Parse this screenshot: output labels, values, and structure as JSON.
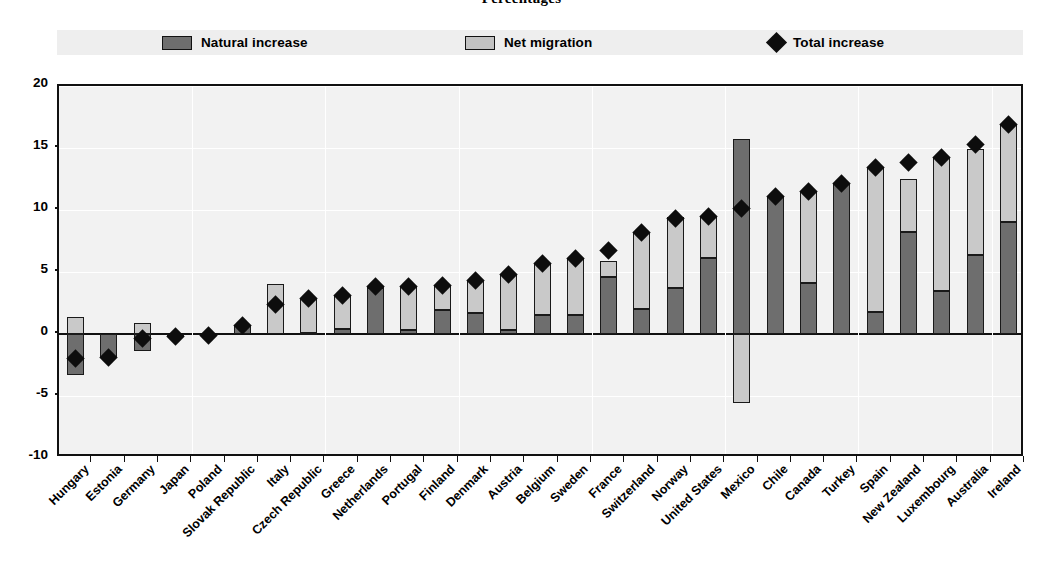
{
  "chart_data": {
    "type": "bar",
    "subtype": "stacked-bar-with-marker",
    "title": "Percentages",
    "xlabel": "",
    "ylabel": "",
    "ylim": [
      -10,
      20
    ],
    "yticks": [
      20,
      15,
      10,
      5,
      0,
      -5,
      -10
    ],
    "ytick_labels": [
      "20",
      "15",
      "10",
      "5",
      "0",
      "-5",
      "-10"
    ],
    "grid": true,
    "legend_position": "top",
    "colors": {
      "natural_increase": "#6e6e6e",
      "net_migration": "#c9c9c9",
      "total_increase": "#0d0d0d",
      "plot_background": "#f2f2f2",
      "legend_background": "#eeeeee",
      "axis": "#111111"
    },
    "legend": [
      {
        "label": "Natural increase",
        "marker": "square",
        "color": "#6e6e6e"
      },
      {
        "label": "Net migration",
        "marker": "square",
        "color": "#c9c9c9"
      },
      {
        "label": "Total increase",
        "marker": "diamond",
        "color": "#0d0d0d"
      }
    ],
    "categories": [
      "Hungary",
      "Estonia",
      "Germany",
      "Japan",
      "Poland",
      "Slovak Republic",
      "Italy",
      "Czech Republic",
      "Greece",
      "Netherlands",
      "Portugal",
      "Finland",
      "Denmark",
      "Austria",
      "Belgium",
      "Sweden",
      "France",
      "Switzerland",
      "Norway",
      "United States",
      "Mexico",
      "Chile",
      "Canada",
      "Turkey",
      "Spain",
      "New Zealand",
      "Luxembourg",
      "Australia",
      "Ireland"
    ],
    "series": [
      {
        "name": "Natural increase",
        "values": [
          -3.3,
          -1.9,
          -1.4,
          -0.2,
          -0.1,
          0.7,
          0.0,
          0.1,
          0.4,
          3.7,
          0.3,
          1.9,
          1.7,
          0.3,
          1.5,
          1.5,
          4.6,
          2.0,
          3.7,
          6.1,
          15.7,
          11.1,
          4.1,
          12.1,
          1.8,
          8.2,
          3.5,
          6.4,
          9.0
        ]
      },
      {
        "name": "Net migration",
        "values": [
          1.4,
          0.0,
          0.9,
          0.0,
          0.0,
          0.0,
          4.0,
          2.8,
          2.7,
          0.1,
          3.5,
          2.0,
          2.6,
          4.5,
          4.2,
          4.6,
          1.3,
          6.2,
          5.7,
          3.4,
          -5.6,
          0.0,
          7.4,
          0.0,
          11.6,
          4.3,
          10.7,
          8.5,
          7.9
        ]
      },
      {
        "name": "Total increase",
        "values": [
          -2.0,
          -1.9,
          -0.4,
          -0.2,
          -0.1,
          0.7,
          2.4,
          2.9,
          3.1,
          3.8,
          3.8,
          3.9,
          4.3,
          4.8,
          5.7,
          6.1,
          6.7,
          8.2,
          9.3,
          9.5,
          10.1,
          11.1,
          11.5,
          12.1,
          13.4,
          13.8,
          14.2,
          15.3,
          16.9
        ]
      }
    ]
  }
}
